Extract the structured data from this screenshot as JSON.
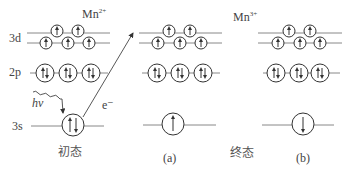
{
  "diagram": {
    "levels": {
      "d": "3d",
      "p": "2p",
      "s": "3s"
    },
    "initial": {
      "ion_label": "Mn",
      "ion_charge": "2+",
      "caption": "初态",
      "photon_label": "hν",
      "electron_label": "e⁻",
      "s_state": "↑↓"
    },
    "final": {
      "ion_label": "Mn",
      "ion_charge": "3+",
      "caption": "终态",
      "panels": [
        {
          "tag": "(a)",
          "s_state": "↑"
        },
        {
          "tag": "(b)",
          "s_state": "↓"
        }
      ]
    },
    "colors": {
      "line": "#555555",
      "text": "#444444",
      "background": "#ffffff"
    }
  }
}
